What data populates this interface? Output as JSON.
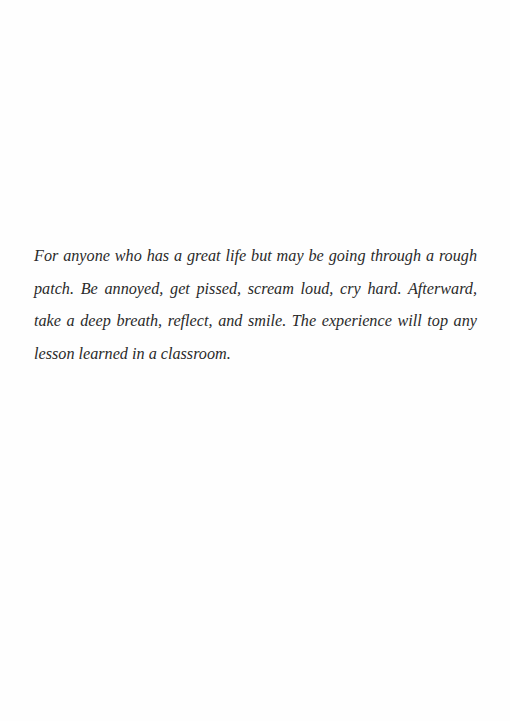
{
  "page": {
    "dedication": "For anyone who has a great life but may be going through a rough patch. Be annoyed, get pissed, scream loud, cry hard. Afterward, take a deep breath, reflect, and smile. The experience will top any lesson learned in a classroom."
  }
}
